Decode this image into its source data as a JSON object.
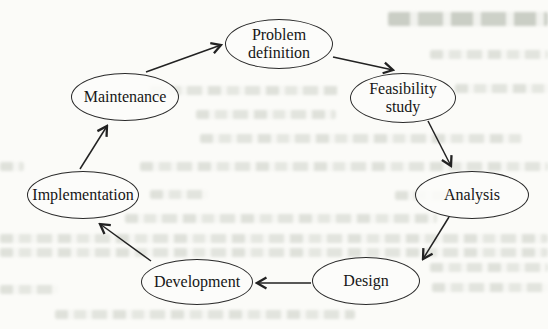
{
  "diagram": {
    "type": "cycle",
    "nodes": [
      {
        "id": "problem-definition",
        "label": "Problem definition"
      },
      {
        "id": "feasibility-study",
        "label": "Feasibility study"
      },
      {
        "id": "analysis",
        "label": "Analysis"
      },
      {
        "id": "design",
        "label": "Design"
      },
      {
        "id": "development",
        "label": "Development"
      },
      {
        "id": "implementation",
        "label": "Implementation"
      },
      {
        "id": "maintenance",
        "label": "Maintenance"
      }
    ],
    "edges": [
      {
        "from": "maintenance",
        "to": "problem-definition"
      },
      {
        "from": "problem-definition",
        "to": "feasibility-study"
      },
      {
        "from": "feasibility-study",
        "to": "analysis"
      },
      {
        "from": "analysis",
        "to": "design"
      },
      {
        "from": "design",
        "to": "development"
      },
      {
        "from": "development",
        "to": "implementation"
      },
      {
        "from": "implementation",
        "to": "maintenance"
      }
    ],
    "colors": {
      "node_stroke": "#2a2a2a",
      "node_text": "#161616",
      "arrow": "#222222",
      "paper": "#fbfbf8",
      "bleedthrough": "#949c8c"
    }
  }
}
